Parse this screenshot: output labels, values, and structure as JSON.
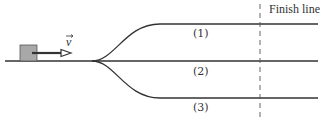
{
  "diagram": {
    "finish_label": "Finish line",
    "velocity_label": "v",
    "tracks": [
      {
        "label": "(1)"
      },
      {
        "label": "(2)"
      },
      {
        "label": "(3)"
      }
    ],
    "colors": {
      "line": "#333333",
      "block_fill": "#a8a8a8",
      "block_stroke": "#555555"
    }
  }
}
